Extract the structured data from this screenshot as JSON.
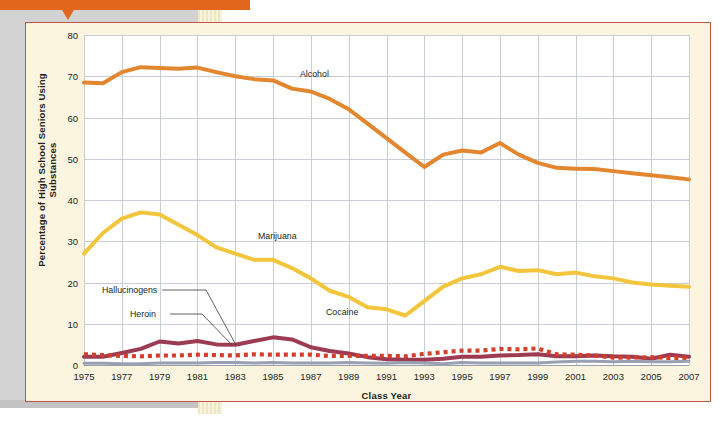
{
  "callout": {
    "text": "steroids (1.5 percent)."
  },
  "chart": {
    "ylabel": "Percentage of High School Seniors Using Substances",
    "xlabel": "Class Year",
    "annotations": {
      "alcohol": "Alcohol",
      "marijuana": "Marijuana",
      "cocaine": "Cocaine",
      "hallucinogens": "Hallucinogens",
      "heroin": "Heroin"
    }
  },
  "colors": {
    "alcohol": "#e2872f",
    "marijuana": "#f2c53c",
    "cocaine": "#9c3b52",
    "hallucinogens": "#d2402a",
    "heroin": "#9aa0b4",
    "card_bg": "#fbf5e0",
    "card_border": "#c0564a",
    "grid": "#c9cdd4",
    "callout_bg": "#e2661b"
  },
  "chart_data": {
    "type": "line",
    "title": "",
    "xlabel": "Class Year",
    "ylabel": "Percentage of High School Seniors Using Substances",
    "xlim": [
      1975,
      2007
    ],
    "ylim": [
      0,
      80
    ],
    "yticks": [
      0,
      10,
      20,
      30,
      40,
      50,
      60,
      70,
      80
    ],
    "xticks": [
      1975,
      1977,
      1979,
      1981,
      1983,
      1985,
      1987,
      1989,
      1991,
      1993,
      1995,
      1997,
      1999,
      2001,
      2003,
      2005,
      2007
    ],
    "grid": true,
    "legend": "inline-annotations",
    "x": [
      1975,
      1976,
      1977,
      1978,
      1979,
      1980,
      1981,
      1982,
      1983,
      1984,
      1985,
      1986,
      1987,
      1988,
      1989,
      1990,
      1991,
      1992,
      1993,
      1994,
      1995,
      1996,
      1997,
      1998,
      1999,
      2000,
      2001,
      2002,
      2003,
      2004,
      2005,
      2006,
      2007
    ],
    "series": [
      {
        "name": "Alcohol",
        "color": "#e2872f",
        "style": "solid",
        "values": [
          68.5,
          68.3,
          71.0,
          72.2,
          72.0,
          71.8,
          72.1,
          71.0,
          70.0,
          69.3,
          69.0,
          67.0,
          66.3,
          64.5,
          62.0,
          58.5,
          55.0,
          51.5,
          48.0,
          51.0,
          52.0,
          51.5,
          53.8,
          51.0,
          49.0,
          47.8,
          47.6,
          47.5,
          47.0,
          46.5,
          46.0,
          45.5,
          45.0
        ]
      },
      {
        "name": "Marijuana",
        "color": "#f2c53c",
        "style": "solid",
        "values": [
          27.0,
          32.0,
          35.5,
          37.0,
          36.5,
          34.0,
          31.5,
          28.5,
          27.0,
          25.5,
          25.5,
          23.5,
          21.0,
          18.0,
          16.5,
          14.0,
          13.5,
          12.0,
          15.5,
          19.0,
          21.0,
          22.0,
          23.8,
          22.8,
          23.0,
          22.0,
          22.4,
          21.5,
          21.0,
          20.0,
          19.5,
          19.2,
          19.0
        ]
      },
      {
        "name": "Cocaine",
        "color": "#9c3b52",
        "style": "solid",
        "values": [
          2.0,
          2.0,
          2.9,
          3.9,
          5.7,
          5.2,
          5.8,
          5.0,
          4.9,
          5.8,
          6.7,
          6.2,
          4.3,
          3.4,
          2.8,
          1.9,
          1.4,
          1.3,
          1.3,
          1.5,
          2.0,
          2.0,
          2.3,
          2.4,
          2.6,
          2.1,
          2.1,
          2.3,
          2.1,
          2.0,
          1.5,
          2.5,
          2.0
        ]
      },
      {
        "name": "Hallucinogens",
        "color": "#d2402a",
        "style": "dotted",
        "values": [
          2.6,
          2.4,
          2.2,
          2.1,
          2.3,
          2.3,
          2.5,
          2.4,
          2.3,
          2.6,
          2.5,
          2.5,
          2.5,
          2.2,
          2.2,
          2.2,
          2.2,
          2.1,
          2.7,
          3.1,
          3.5,
          3.5,
          3.9,
          3.8,
          4.0,
          2.6,
          2.5,
          2.3,
          1.8,
          1.8,
          1.9,
          1.7,
          1.7
        ]
      },
      {
        "name": "Heroin",
        "color": "#9aa0b4",
        "style": "solid",
        "values": [
          0.4,
          0.4,
          0.3,
          0.3,
          0.5,
          0.5,
          0.5,
          0.6,
          0.6,
          0.5,
          0.6,
          0.5,
          0.5,
          0.5,
          0.6,
          0.5,
          0.4,
          0.6,
          0.5,
          0.3,
          0.6,
          0.5,
          0.5,
          0.5,
          0.5,
          0.7,
          0.9,
          0.9,
          0.8,
          0.9,
          0.8,
          0.8,
          0.9
        ]
      }
    ]
  }
}
